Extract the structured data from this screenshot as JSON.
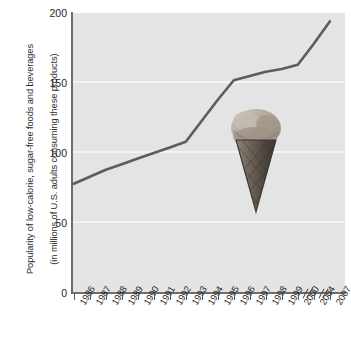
{
  "chart_data": {
    "type": "line",
    "title": "",
    "xlabel": "",
    "ylabel": "Popularity of low-calorie, sugar-free foods and beverages\n(in millions of U.S. adults consuming these products)",
    "ylabel_line1": "Popularity of low-calorie, sugar-free foods and beverages",
    "ylabel_line2": "(in millions of U.S. adults consuming these products)",
    "categories": [
      "1986",
      "1987",
      "1988",
      "1989",
      "1990",
      "1991",
      "1992",
      "1993",
      "1994",
      "1995",
      "1996",
      "1997",
      "1998",
      "1999",
      "2000",
      "2004",
      "2007"
    ],
    "values": [
      78,
      83,
      88,
      92,
      96,
      100,
      104,
      108,
      123,
      138,
      152,
      155,
      158,
      160,
      163,
      178,
      194
    ],
    "series": [
      {
        "name": "Popularity of low-calorie, sugar-free foods and beverages",
        "values": [
          78,
          83,
          88,
          92,
          96,
          100,
          104,
          108,
          123,
          138,
          152,
          155,
          158,
          160,
          163,
          178,
          194
        ]
      }
    ],
    "yticks": [
      0,
      50,
      100,
      150,
      200
    ],
    "ytick_labels": [
      "0",
      "50",
      "100",
      "150",
      "200"
    ],
    "ylim": [
      0,
      200
    ],
    "xtick_labels": [
      "1986",
      "1987",
      "1988",
      "1989",
      "1990",
      "1991",
      "1992",
      "1993",
      "1994",
      "1995",
      "1996",
      "1997",
      "1998",
      "1999",
      "2000",
      "2004",
      "2007"
    ],
    "axis_breaks_after": [
      "2000",
      "2004"
    ],
    "grid": "horizontal",
    "legend": "none",
    "annotations": [
      "ice-cream-cone-photo"
    ],
    "colors": {
      "line": "#5c5c5c",
      "plot_background": "#e4e4e4",
      "gridline": "#f4f4f4",
      "axis": "#6d6d6d",
      "text": "#1f1f1f",
      "page_background": "#ffffff"
    }
  },
  "graphic": {
    "cone_label": "ice-cream-cone"
  }
}
